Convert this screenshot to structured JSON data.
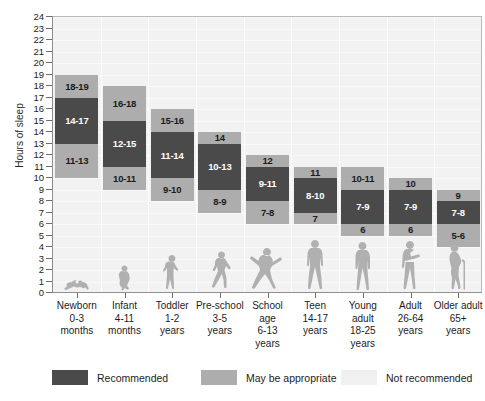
{
  "chart_data": {
    "type": "bar",
    "title": "",
    "xlabel": "",
    "ylabel": "Hours of sleep",
    "ylim": [
      0,
      24
    ],
    "ytick_values": [
      0,
      1,
      2,
      3,
      4,
      5,
      6,
      7,
      8,
      9,
      10,
      11,
      12,
      13,
      14,
      15,
      16,
      17,
      18,
      19,
      20,
      21,
      22,
      23,
      24
    ],
    "grid": true,
    "legend_position": "bottom",
    "categories": [
      "Newborn 0-3 months",
      "Infant 4-11 months",
      "Toddler 1-2 years",
      "Pre-school 3-5 years",
      "School age 6-13 years",
      "Teen 14-17 years",
      "Young adult 18-25 years",
      "Adult 26-64 years",
      "Older adult 65+ years"
    ],
    "series": [
      {
        "name": "May be appropriate (lower)",
        "color": "#adadad",
        "ranges": [
          [
            11,
            13
          ],
          [
            10,
            11
          ],
          [
            9,
            10
          ],
          [
            8,
            9
          ],
          [
            7,
            8
          ],
          [
            7,
            7
          ],
          [
            6,
            6
          ],
          [
            6,
            6
          ],
          [
            5,
            6
          ]
        ],
        "labels": [
          "11-13",
          "10-11",
          "9-10",
          "8-9",
          "7-8",
          "7",
          "6",
          "6",
          "5-6"
        ]
      },
      {
        "name": "Recommended",
        "color": "#4a4a4a",
        "ranges": [
          [
            14,
            17
          ],
          [
            12,
            15
          ],
          [
            11,
            14
          ],
          [
            10,
            13
          ],
          [
            9,
            11
          ],
          [
            8,
            10
          ],
          [
            7,
            9
          ],
          [
            7,
            9
          ],
          [
            7,
            8
          ]
        ],
        "labels": [
          "14-17",
          "12-15",
          "11-14",
          "10-13",
          "9-11",
          "8-10",
          "7-9",
          "7-9",
          "7-8"
        ]
      },
      {
        "name": "May be appropriate (upper)",
        "color": "#adadad",
        "ranges": [
          [
            18,
            19
          ],
          [
            16,
            18
          ],
          [
            15,
            16
          ],
          [
            14,
            14
          ],
          [
            12,
            12
          ],
          [
            11,
            11
          ],
          [
            10,
            11
          ],
          [
            10,
            10
          ],
          [
            9,
            9
          ]
        ],
        "labels": [
          "18-19",
          "16-18",
          "15-16",
          "14",
          "12",
          "11",
          "10-11",
          "10",
          "9"
        ]
      }
    ]
  },
  "axis": {
    "y_title": "Hours of sleep",
    "ticks": [
      "24",
      "23",
      "22",
      "21",
      "20",
      "19",
      "18",
      "17",
      "16",
      "15",
      "14",
      "13",
      "12",
      "11",
      "10",
      "9",
      "8",
      "7",
      "6",
      "5",
      "4",
      "3",
      "2",
      "1",
      "0"
    ]
  },
  "groups": [
    {
      "id": "newborn",
      "name": [
        "Newborn",
        "0-3",
        "months"
      ],
      "lower": {
        "from": 11,
        "to": 13,
        "label": "11-13"
      },
      "rec": {
        "from": 14,
        "to": 17,
        "label": "14-17"
      },
      "upper": {
        "from": 18,
        "to": 19,
        "label": "18-19"
      },
      "silhouette": "baby-crawling-icon"
    },
    {
      "id": "infant",
      "name": [
        "Infant",
        "4-11",
        "months"
      ],
      "lower": {
        "from": 10,
        "to": 11,
        "label": "10-11"
      },
      "rec": {
        "from": 12,
        "to": 15,
        "label": "12-15"
      },
      "upper": {
        "from": 16,
        "to": 18,
        "label": "16-18"
      },
      "silhouette": "baby-sitting-icon"
    },
    {
      "id": "toddler",
      "name": [
        "Toddler",
        "1-2",
        "years"
      ],
      "lower": {
        "from": 9,
        "to": 10,
        "label": "9-10"
      },
      "rec": {
        "from": 11,
        "to": 14,
        "label": "11-14"
      },
      "upper": {
        "from": 15,
        "to": 16,
        "label": "15-16"
      },
      "silhouette": "toddler-standing-icon"
    },
    {
      "id": "preschool",
      "name": [
        "Pre-school",
        "3-5",
        "years"
      ],
      "lower": {
        "from": 8,
        "to": 9,
        "label": "8-9"
      },
      "rec": {
        "from": 10,
        "to": 13,
        "label": "10-13"
      },
      "upper": {
        "from": 14,
        "to": 14,
        "label": "14"
      },
      "silhouette": "child-running-icon"
    },
    {
      "id": "schoolage",
      "name": [
        "School",
        "age",
        "6-13",
        "years"
      ],
      "lower": {
        "from": 7,
        "to": 8,
        "label": "7-8"
      },
      "rec": {
        "from": 9,
        "to": 11,
        "label": "9-11"
      },
      "upper": {
        "from": 12,
        "to": 12,
        "label": "12"
      },
      "silhouette": "child-jumping-icon"
    },
    {
      "id": "teen",
      "name": [
        "Teen",
        "14-17",
        "years"
      ],
      "lower": {
        "from": 7,
        "to": 7,
        "label": "7"
      },
      "rec": {
        "from": 8,
        "to": 10,
        "label": "8-10"
      },
      "upper": {
        "from": 11,
        "to": 11,
        "label": "11"
      },
      "silhouette": "teen-standing-icon"
    },
    {
      "id": "youngadult",
      "name": [
        "Young adult",
        "18-25",
        "years"
      ],
      "lower": {
        "from": 6,
        "to": 6,
        "label": "6"
      },
      "rec": {
        "from": 7,
        "to": 9,
        "label": "7-9"
      },
      "upper": {
        "from": 10,
        "to": 11,
        "label": "10-11"
      },
      "silhouette": "young-adult-standing-icon"
    },
    {
      "id": "adult",
      "name": [
        "Adult",
        "26-64",
        "years"
      ],
      "lower": {
        "from": 6,
        "to": 6,
        "label": "6"
      },
      "rec": {
        "from": 7,
        "to": 9,
        "label": "7-9"
      },
      "upper": {
        "from": 10,
        "to": 10,
        "label": "10"
      },
      "silhouette": "adult-standing-icon"
    },
    {
      "id": "olderadult",
      "name": [
        "Older adult",
        "65+",
        "years"
      ],
      "lower": {
        "from": 5,
        "to": 6,
        "label": "5-6"
      },
      "rec": {
        "from": 7,
        "to": 8,
        "label": "7-8"
      },
      "upper": {
        "from": 9,
        "to": 9,
        "label": "9"
      },
      "silhouette": "older-adult-cane-icon"
    }
  ],
  "legend": {
    "items": [
      {
        "label": "Recommended",
        "color": "#4a4a4a"
      },
      {
        "label": "May be appropriate",
        "color": "#adadad"
      },
      {
        "label": "Not recommended",
        "color": "#f0f0f0"
      }
    ]
  },
  "colors": {
    "recommended": "#4a4a4a",
    "may_be_appropriate": "#adadad",
    "not_recommended": "#f0f0f0",
    "plot_background": "#f2f2f2"
  }
}
